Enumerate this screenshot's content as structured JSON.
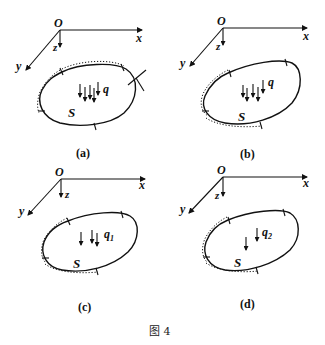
{
  "figure_caption": "图 4",
  "panels": [
    {
      "id": "a",
      "caption": "(a)",
      "origin_label": "O",
      "axes": {
        "x": "x",
        "y": "y",
        "z": "z"
      },
      "region_label": "S",
      "load_label": "q",
      "load_sub": "",
      "load_arrow_count": 4,
      "fixed_boundary": "upper-left",
      "extra_cut_line": true
    },
    {
      "id": "b",
      "caption": "(b)",
      "origin_label": "O",
      "axes": {
        "x": "x",
        "y": "y",
        "z": "z"
      },
      "region_label": "S",
      "load_label": "q",
      "load_sub": "",
      "load_arrow_count": 4,
      "fixed_boundary": "left-bottom",
      "extra_cut_line": false
    },
    {
      "id": "c",
      "caption": "(c)",
      "origin_label": "O",
      "axes": {
        "x": "x",
        "y": "y",
        "z": "z"
      },
      "region_label": "S",
      "load_label": "q",
      "load_sub": "1",
      "load_arrow_count": 3,
      "fixed_boundary": "left-bottom",
      "extra_cut_line": false
    },
    {
      "id": "d",
      "caption": "(d)",
      "origin_label": "O",
      "axes": {
        "x": "x",
        "y": "y",
        "z": "z"
      },
      "region_label": "S",
      "load_label": "q",
      "load_sub": "2",
      "load_arrow_count": 2,
      "fixed_boundary": "left-bottom",
      "extra_cut_line": false
    }
  ]
}
